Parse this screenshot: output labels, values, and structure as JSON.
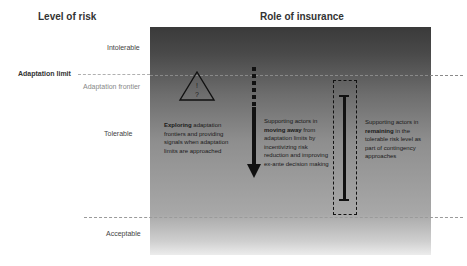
{
  "headers": {
    "level_of_risk": "Level of risk",
    "role_of_insurance": "Role of insurance"
  },
  "risk_levels": {
    "intolerable": "Intolerable",
    "tolerable": "Tolerable",
    "acceptable": "Acceptable"
  },
  "thresholds": {
    "adaptation_limit": "Adaptation limit",
    "adaptation_frontier": "Adaptation frontier"
  },
  "triangle": {
    "mark_top": "!",
    "mark_bottom": "?",
    "icon": "warning-triangle"
  },
  "roles": [
    {
      "bold": "Exploring",
      "text": " adaptation frontiers and providing signals when adaptation limits are approached",
      "icon": "warning-triangle"
    },
    {
      "prefix": "Supporting actors in ",
      "bold": "moving away",
      "text": " from adaptation limits by incentivizing risk reduction and improving ex-ante decision making",
      "icon": "down-arrow"
    },
    {
      "prefix": "Supporting actors in ",
      "bold": "remaining",
      "text": " in the tolerable risk level as part of contingency approaches",
      "icon": "range-bar"
    }
  ],
  "colors": {
    "panel_top": "#3a3a3a",
    "panel_bottom": "#ececec",
    "dashed_line": "#b0b0b0",
    "icons": "#111111"
  }
}
